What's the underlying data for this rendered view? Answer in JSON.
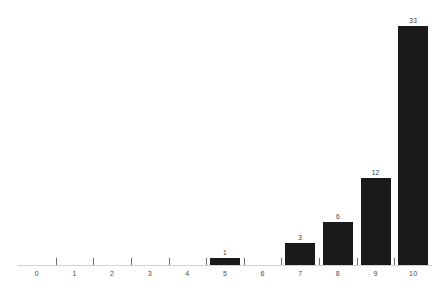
{
  "chart_data": {
    "type": "bar",
    "title": "",
    "subtitle": "",
    "xlabel": "",
    "ylabel": "",
    "categories": [
      "0",
      "1",
      "2",
      "3",
      "4",
      "5",
      "6",
      "7",
      "8",
      "9",
      "10"
    ],
    "values": [
      0,
      0,
      0,
      0,
      0,
      1,
      0,
      3,
      6,
      12,
      33
    ],
    "data_labels": [
      "",
      "",
      "",
      "",
      "",
      "1",
      "",
      "3",
      "6",
      "12",
      "33"
    ],
    "ylim": [
      0,
      33
    ],
    "grid": false,
    "legend": false,
    "legend_position": "none",
    "series": [
      {
        "name": "count",
        "values": [
          0,
          0,
          0,
          0,
          0,
          1,
          0,
          3,
          6,
          12,
          33
        ]
      }
    ],
    "colors": {
      "bar": "#1a1a1a",
      "axis_line": "#d2d2d2",
      "tick": "#6f6f6f",
      "tick_label": "#4a4a4a",
      "value_label": "#3a3a3a",
      "background": "#ffffff"
    }
  }
}
